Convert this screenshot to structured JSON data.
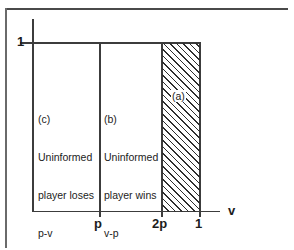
{
  "figure": {
    "title": "",
    "type": "diagram",
    "axes": {
      "x": {
        "variable_label": "v",
        "ticks": [
          "p",
          "2p",
          "1"
        ],
        "range": [
          0,
          1
        ]
      },
      "y": {
        "variable_label": "",
        "ticks": [
          "1"
        ],
        "range": [
          0,
          1
        ]
      }
    },
    "regions": [
      {
        "id": "c",
        "tag": "(c)",
        "line1": "Uninformed",
        "line2": "player loses",
        "line3": "p-v",
        "span": "0 to p",
        "filled": false
      },
      {
        "id": "b",
        "tag": "(b)",
        "line1": "Uninformed",
        "line2": "player wins",
        "line3": "v-p",
        "span": "p to 2p",
        "filled": false
      },
      {
        "id": "a",
        "tag": "(a)",
        "line1": "",
        "line2": "",
        "line3": "",
        "span": "2p to 1",
        "filled": true,
        "fill_style": "diagonal-hatch"
      }
    ],
    "colors": {
      "ink": "#1c1c1c",
      "line": "#3c3c3c",
      "frame": "#4a4a4a",
      "hatch": "#2e2e2e",
      "background": "#ffffff"
    }
  }
}
